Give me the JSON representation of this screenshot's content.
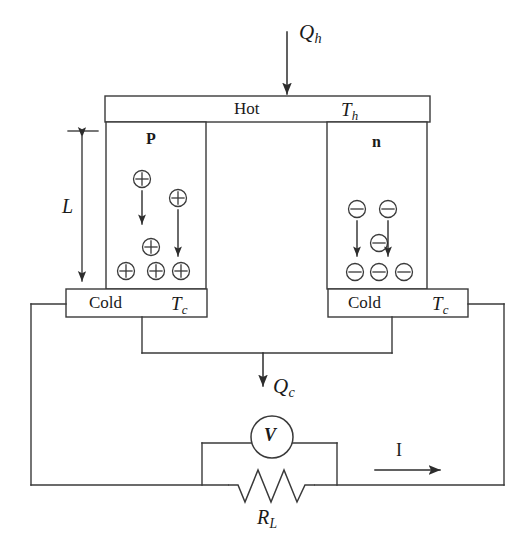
{
  "figure": {
    "stroke_color": "#3a3a3a",
    "fill_color": "#ffffff",
    "background": "#ffffff"
  },
  "hot_side": {
    "label": "Hot",
    "temperature_symbol": "T",
    "temperature_subscript": "h",
    "heat_in_symbol": "Q",
    "heat_in_subscript": "h"
  },
  "cold_side": {
    "left": {
      "label": "Cold",
      "temperature_symbol": "T",
      "temperature_subscript": "c"
    },
    "right": {
      "label": "Cold",
      "temperature_symbol": "T",
      "temperature_subscript": "c"
    },
    "heat_out_symbol": "Q",
    "heat_out_subscript": "c"
  },
  "legs": {
    "p_leg": {
      "label": "P",
      "carrier_sign": "+",
      "carrier_count": 6,
      "carriers": [
        {
          "cx": 142,
          "cy": 179
        },
        {
          "cx": 178,
          "cy": 198
        },
        {
          "cx": 151,
          "cy": 247
        },
        {
          "cx": 126,
          "cy": 271
        },
        {
          "cx": 156,
          "cy": 271
        },
        {
          "cx": 181,
          "cy": 271
        }
      ],
      "drift_arrows": [
        {
          "x": 142,
          "y1": 190,
          "y2": 224
        },
        {
          "x": 178,
          "y1": 210,
          "y2": 256
        }
      ]
    },
    "n_leg": {
      "label": "n",
      "carrier_sign": "−",
      "carrier_count": 6,
      "carriers": [
        {
          "cx": 357,
          "cy": 209
        },
        {
          "cx": 388,
          "cy": 209
        },
        {
          "cx": 379,
          "cy": 243
        },
        {
          "cx": 355,
          "cy": 272
        },
        {
          "cx": 379,
          "cy": 272
        },
        {
          "cx": 404,
          "cy": 272
        }
      ],
      "drift_arrows": [
        {
          "x": 357,
          "y1": 222,
          "y2": 254
        },
        {
          "x": 388,
          "y1": 222,
          "y2": 254
        }
      ]
    }
  },
  "dimension": {
    "length_label": "L",
    "y_top": 131,
    "y_bottom": 285,
    "x": 82
  },
  "circuit": {
    "voltmeter_label": "V",
    "load_resistor_symbol": "R",
    "load_resistor_subscript": "L",
    "current_label": "I",
    "current_direction": "right"
  }
}
